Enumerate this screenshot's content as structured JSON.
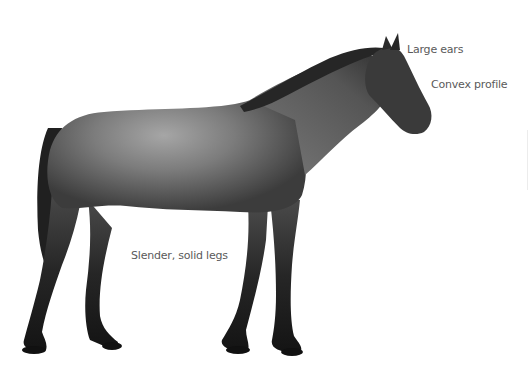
{
  "figure": {
    "background_color": "#ffffff",
    "coat_colors": {
      "light": "#9a9a9a",
      "mid": "#6e6e6e",
      "dark": "#2a2a2a",
      "legs": "#1c1c1c"
    },
    "labels": [
      {
        "id": "ears",
        "text": "Large ears"
      },
      {
        "id": "profile",
        "text": "Convex profile"
      },
      {
        "id": "legs",
        "text": "Slender, solid legs"
      }
    ]
  }
}
